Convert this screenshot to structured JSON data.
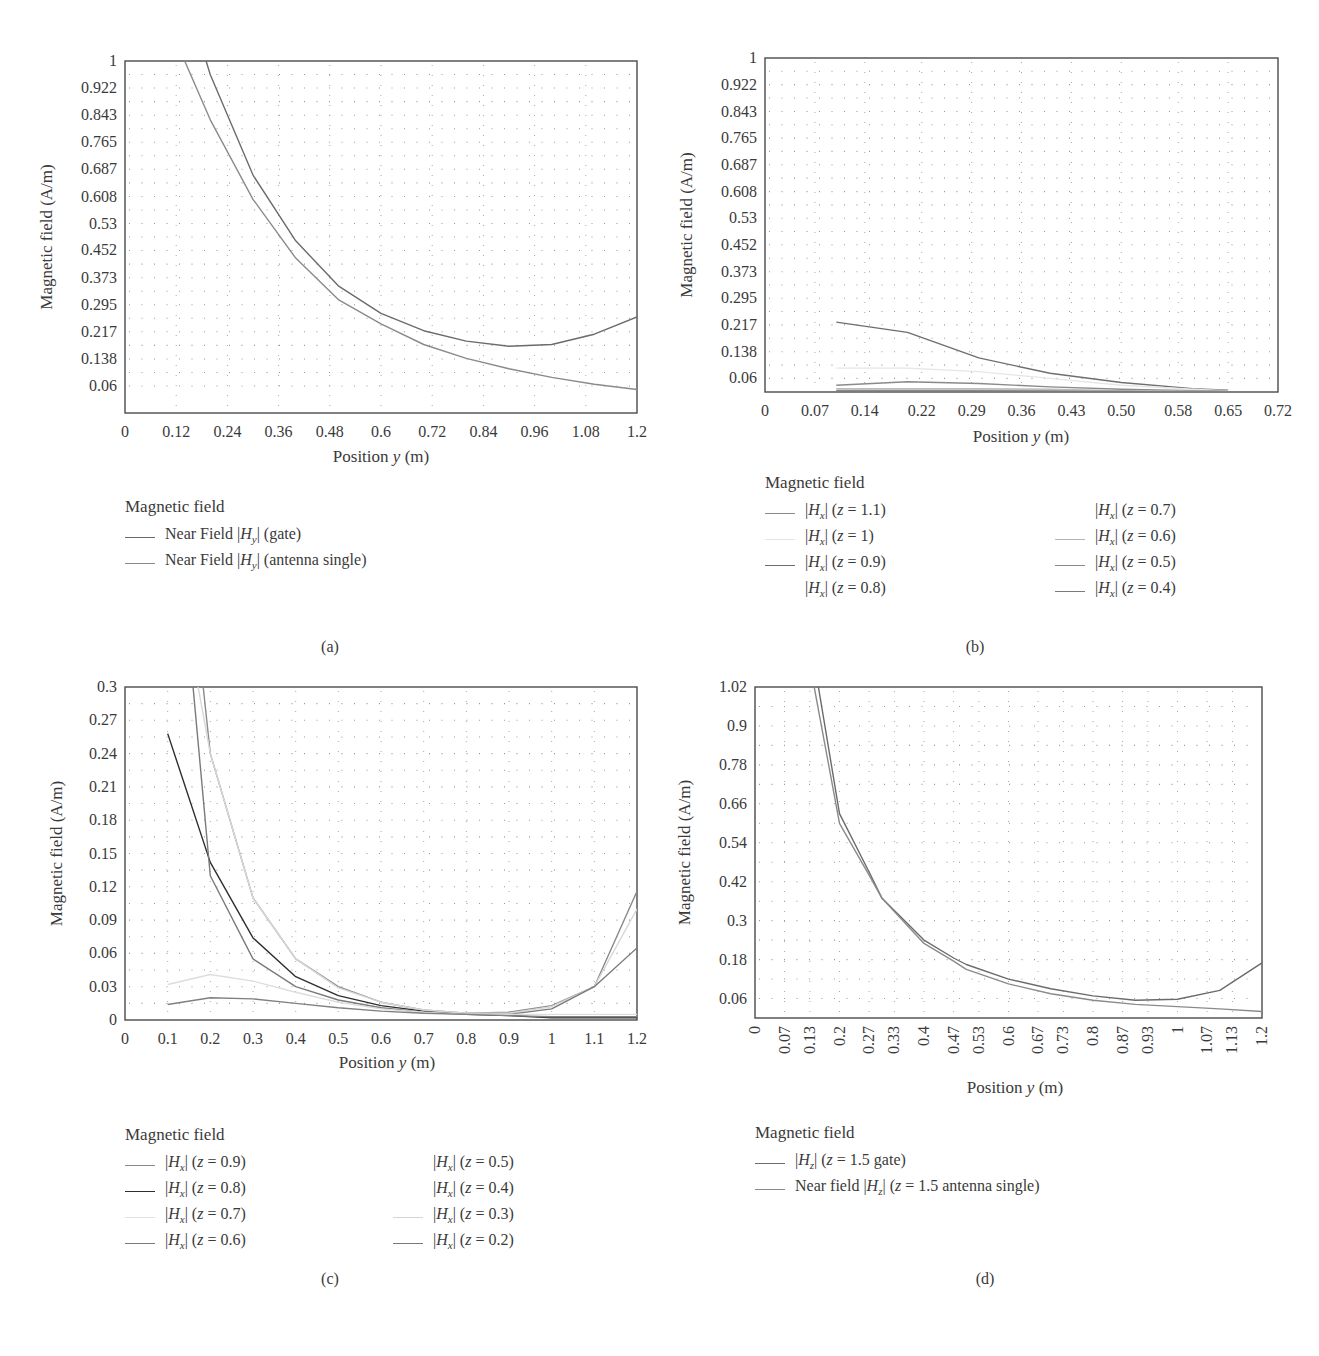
{
  "panels": {
    "a": {
      "label": "(a)",
      "ylabel": "Magnetic field (A/m)",
      "xlabel": "Position y (m)",
      "legend_title": "Magnetic field",
      "legend": [
        {
          "text": "Near Field |Hy| (gate)",
          "color": "#6b6b6b"
        },
        {
          "text": "Near Field |Hy| (antenna single)",
          "color": "#8a8a8a"
        }
      ]
    },
    "b": {
      "label": "(b)",
      "ylabel": "Magnetic field (A/m)",
      "xlabel": "Position y (m)",
      "legend_title": "Magnetic field",
      "legend_left": [
        {
          "text": "|Hx| (z = 1.1)",
          "color": "#8a8a8a"
        },
        {
          "text": "|Hx| (z = 1)",
          "color": "#e2e2e2"
        },
        {
          "text": "|Hx| (z = 0.9)",
          "color": "#6e6e6e"
        },
        {
          "text": "|Hx| (z = 0.8)",
          "color": "transparent"
        }
      ],
      "legend_right": [
        {
          "text": "|Hx| (z = 0.7)",
          "color": "transparent"
        },
        {
          "text": "|Hx| (z = 0.6)",
          "color": "#b5b5b5"
        },
        {
          "text": "|Hx| (z = 0.5)",
          "color": "#8a8a8a"
        },
        {
          "text": "|Hx| (z = 0.4)",
          "color": "#7a7a7a"
        }
      ]
    },
    "c": {
      "label": "(c)",
      "ylabel": "Magnetic field (A/m)",
      "xlabel": "Position y (m)",
      "legend_title": "Magnetic field",
      "legend_left": [
        {
          "text": "|Hx| (z = 0.9)",
          "color": "#8a8a8a"
        },
        {
          "text": "|Hx| (z = 0.8)",
          "color": "#2e2e2e"
        },
        {
          "text": "|Hx| (z = 0.7)",
          "color": "#e2e2e2"
        },
        {
          "text": "|Hx| (z = 0.6)",
          "color": "#7a7a7a"
        }
      ],
      "legend_right": [
        {
          "text": "|Hx| (z = 0.5)",
          "color": "transparent"
        },
        {
          "text": "|Hx| (z = 0.4)",
          "color": "transparent"
        },
        {
          "text": "|Hx| (z = 0.3)",
          "color": "#d5d5d5"
        },
        {
          "text": "|Hx| (z = 0.2)",
          "color": "#7a7a7a"
        }
      ]
    },
    "d": {
      "label": "(d)",
      "ylabel": "Magnetic field (A/m)",
      "xlabel": "Position y (m)",
      "legend_title": "Magnetic field",
      "legend": [
        {
          "text": "|Hz| (z = 1.5 gate)",
          "color": "#6b6b6b"
        },
        {
          "text": "Near field |Hz| (z = 1.5 antenna single)",
          "color": "#8a8a8a"
        }
      ]
    }
  },
  "chart_data": [
    {
      "id": "a",
      "type": "line",
      "title": "",
      "xlabel": "Position y (m)",
      "ylabel": "Magnetic field (A/m)",
      "xlim": [
        0,
        1.2
      ],
      "ylim": [
        -0.018,
        1
      ],
      "xticks": [
        "0",
        "0.12",
        "0.24",
        "0.36",
        "0.48",
        "0.6",
        "0.72",
        "0.84",
        "0.96",
        "1.08",
        "1.2"
      ],
      "yticks": [
        "1",
        "0.922",
        "0.843",
        "0.765",
        "0.687",
        "0.608",
        "0.53",
        "0.452",
        "0.373",
        "0.295",
        "0.217",
        "0.138",
        "0.06"
      ],
      "grid": "dotted",
      "legend_position": "below",
      "x": [
        0.14,
        0.2,
        0.3,
        0.4,
        0.5,
        0.6,
        0.7,
        0.8,
        0.9,
        1.0,
        1.1,
        1.2
      ],
      "series": [
        {
          "name": "Near Field |Hy| (gate)",
          "x": [
            0.19,
            0.2,
            0.3,
            0.4,
            0.5,
            0.6,
            0.7,
            0.8,
            0.9,
            1.0,
            1.1,
            1.2
          ],
          "values": [
            1.0,
            0.96,
            0.67,
            0.48,
            0.35,
            0.27,
            0.22,
            0.19,
            0.175,
            0.18,
            0.21,
            0.26
          ]
        },
        {
          "name": "Near Field |Hy| (antenna single)",
          "x": [
            0.14,
            0.2,
            0.3,
            0.4,
            0.5,
            0.6,
            0.7,
            0.8,
            0.9,
            1.0,
            1.1,
            1.2
          ],
          "values": [
            1.0,
            0.83,
            0.6,
            0.43,
            0.31,
            0.24,
            0.18,
            0.14,
            0.11,
            0.085,
            0.065,
            0.05
          ]
        }
      ]
    },
    {
      "id": "b",
      "type": "line",
      "title": "",
      "xlabel": "Position y (m)",
      "ylabel": "Magnetic field (A/m)",
      "xlim": [
        0,
        0.72
      ],
      "ylim": [
        0.02,
        1
      ],
      "xticks": [
        "0",
        "0.07",
        "0.14",
        "0.22",
        "0.29",
        "0.36",
        "0.43",
        "0.50",
        "0.58",
        "0.65",
        "0.72"
      ],
      "yticks": [
        "1",
        "0.922",
        "0.843",
        "0.765",
        "0.687",
        "0.608",
        "0.53",
        "0.452",
        "0.373",
        "0.295",
        "0.217",
        "0.138",
        "0.06"
      ],
      "grid": "dotted",
      "legend_position": "below",
      "x": [
        0.1,
        0.2,
        0.3,
        0.4,
        0.5,
        0.6,
        0.65
      ],
      "series": [
        {
          "name": "|Hx| (z = 1.1)",
          "values": [
            0.225,
            0.195,
            0.12,
            0.075,
            0.048,
            0.03,
            0.025
          ]
        },
        {
          "name": "|Hx| (z = 1)",
          "values": [
            0.09,
            0.09,
            0.08,
            0.06,
            0.04,
            0.028,
            0.024
          ]
        },
        {
          "name": "|Hx| (z = 0.9)",
          "values": [
            0.04,
            0.05,
            0.045,
            0.035,
            0.028,
            0.024,
            0.022
          ]
        },
        {
          "name": "|Hx| (z = 0.8)",
          "values": [
            null,
            null,
            null,
            null,
            null,
            null,
            null
          ]
        },
        {
          "name": "|Hx| (z = 0.7)",
          "values": [
            null,
            null,
            null,
            null,
            null,
            null,
            null
          ]
        },
        {
          "name": "|Hx| (z = 0.6)",
          "values": [
            0.03,
            0.03,
            0.03,
            0.028,
            0.024,
            0.022,
            0.021
          ]
        },
        {
          "name": "|Hx| (z = 0.5)",
          "values": [
            0.025,
            0.025,
            0.025,
            0.024,
            0.022,
            0.021,
            0.02
          ]
        },
        {
          "name": "|Hx| (z = 0.4)",
          "values": [
            0.022,
            0.022,
            0.022,
            0.021,
            0.021,
            0.02,
            0.02
          ]
        }
      ]
    },
    {
      "id": "c",
      "type": "line",
      "title": "",
      "xlabel": "Position y (m)",
      "ylabel": "Magnetic field (A/m)",
      "xlim": [
        0,
        1.2
      ],
      "ylim": [
        0,
        0.3
      ],
      "xticks": [
        "0",
        "0.1",
        "0.2",
        "0.3",
        "0.4",
        "0.5",
        "0.6",
        "0.7",
        "0.8",
        "0.9",
        "1",
        "1.1",
        "1.2"
      ],
      "yticks": [
        "0.3",
        "0.27",
        "0.24",
        "0.21",
        "0.18",
        "0.15",
        "0.12",
        "0.09",
        "0.06",
        "0.03",
        "0"
      ],
      "grid": "dotted",
      "legend_position": "below",
      "x": [
        0.1,
        0.2,
        0.3,
        0.4,
        0.5,
        0.6,
        0.7,
        0.8,
        0.9,
        1.0,
        1.1,
        1.2
      ],
      "series": [
        {
          "name": "|Hx| (z = 0.9)",
          "values": [
            0.6,
            0.24,
            0.11,
            0.055,
            0.03,
            0.016,
            0.009,
            0.006,
            0.007,
            0.013,
            0.03,
            0.116
          ]
        },
        {
          "name": "|Hx| (z = 0.8)",
          "values": [
            0.258,
            0.142,
            0.074,
            0.039,
            0.022,
            0.013,
            0.008,
            0.005,
            0.004,
            0.002,
            0.002,
            0.002
          ]
        },
        {
          "name": "|Hx| (z = 0.7)",
          "values": [
            0.45,
            0.24,
            0.11,
            0.055,
            0.029,
            0.016,
            0.009,
            0.006,
            0.006,
            0.012,
            0.03,
            0.1
          ]
        },
        {
          "name": "|Hx| (z = 0.6)",
          "values": [
            0.55,
            0.13,
            0.055,
            0.03,
            0.018,
            0.011,
            0.007,
            0.005,
            0.005,
            0.01,
            0.03,
            0.065
          ]
        },
        {
          "name": "|Hx| (z = 0.5)",
          "values": [
            null,
            null,
            null,
            null,
            null,
            null,
            null,
            null,
            null,
            null,
            null,
            null
          ]
        },
        {
          "name": "|Hx| (z = 0.4)",
          "values": [
            null,
            null,
            null,
            null,
            null,
            null,
            null,
            null,
            null,
            null,
            null,
            null
          ]
        },
        {
          "name": "|Hx| (z = 0.3)",
          "values": [
            0.032,
            0.041,
            0.035,
            0.025,
            0.016,
            0.01,
            0.007,
            0.005,
            0.005,
            0.005,
            0.005,
            0.005
          ]
        },
        {
          "name": "|Hx| (z = 0.2)",
          "values": [
            0.014,
            0.02,
            0.019,
            0.015,
            0.011,
            0.008,
            0.006,
            0.005,
            0.004,
            0.003,
            0.003,
            0.003
          ]
        }
      ]
    },
    {
      "id": "d",
      "type": "line",
      "title": "",
      "xlabel": "Position y (m)",
      "ylabel": "Magnetic field (A/m)",
      "xlim": [
        0,
        1.2
      ],
      "ylim": [
        0,
        1.02
      ],
      "xticks": [
        "0",
        "0.07",
        "0.13",
        "0.2",
        "0.27",
        "0.33",
        "0.4",
        "0.47",
        "0.53",
        "0.6",
        "0.67",
        "0.73",
        "0.8",
        "0.87",
        "0.93",
        "1",
        "1.07",
        "1.13",
        "1.2"
      ],
      "yticks": [
        "1.02",
        "0.9",
        "0.78",
        "0.66",
        "0.54",
        "0.42",
        "0.3",
        "0.18",
        "0.06"
      ],
      "grid": "dotted",
      "legend_position": "below",
      "series": [
        {
          "name": "|Hz| (z = 1.5 gate)",
          "x": [
            0.15,
            0.2,
            0.27,
            0.3,
            0.4,
            0.47,
            0.5,
            0.6,
            0.7,
            0.8,
            0.9,
            1.0,
            1.1,
            1.2
          ],
          "values": [
            1.02,
            0.63,
            0.45,
            0.37,
            0.24,
            0.185,
            0.165,
            0.12,
            0.09,
            0.068,
            0.055,
            0.058,
            0.085,
            0.17
          ]
        },
        {
          "name": "Near field |Hz| (z = 1.5 antenna single)",
          "x": [
            0.14,
            0.2,
            0.27,
            0.3,
            0.4,
            0.47,
            0.5,
            0.6,
            0.7,
            0.8,
            0.9,
            1.0,
            1.1,
            1.2
          ],
          "values": [
            1.02,
            0.6,
            0.44,
            0.37,
            0.23,
            0.175,
            0.15,
            0.105,
            0.075,
            0.055,
            0.042,
            0.035,
            0.028,
            0.02
          ]
        }
      ]
    }
  ]
}
